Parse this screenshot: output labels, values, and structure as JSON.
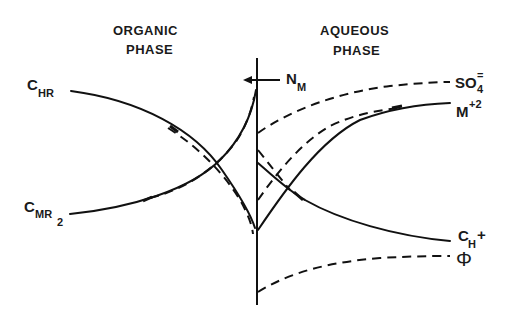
{
  "diagram": {
    "phases": {
      "organic": {
        "line1": "ORGANIC",
        "line2": "PHASE"
      },
      "aqueous": {
        "line1": "AQUEOUS",
        "line2": "PHASE"
      }
    },
    "flux_label": {
      "main": "N",
      "sub": "M"
    },
    "left_labels": {
      "c_hr": {
        "main": "C",
        "sub": "HR"
      },
      "c_mr2": {
        "main": "C",
        "sub": "MR",
        "sub2": "2"
      }
    },
    "right_labels": {
      "so4": {
        "main": "SO",
        "sub": "4",
        "sup": "="
      },
      "m2": {
        "main": "M",
        "sup": "+2"
      },
      "ch": {
        "main": "C",
        "sub": "H",
        "sup": "+"
      },
      "phi": {
        "main": "Φ"
      }
    },
    "legend_semantics": {
      "solid": "concentration profile",
      "dashed": "profile variant / potential"
    },
    "colors": {
      "ink": "#111111",
      "background": "#ffffff"
    }
  }
}
